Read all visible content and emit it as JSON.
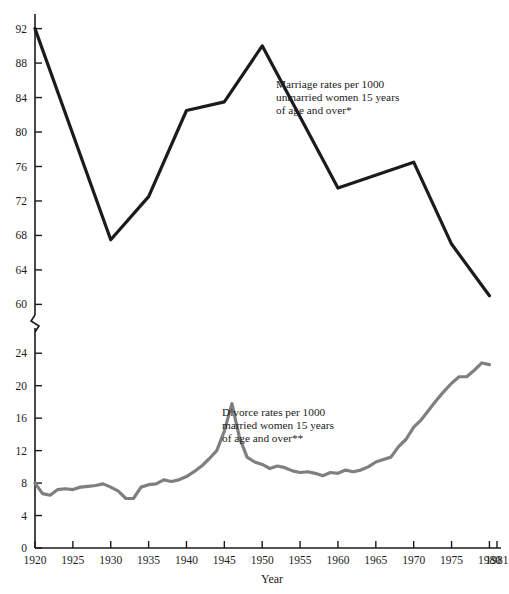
{
  "chart_data": {
    "type": "line",
    "title": "",
    "xlabel": "Year",
    "ylabel": "",
    "grid": false,
    "legend_position": "inline-annotations",
    "broken_axis": true,
    "axis_break_note": "Y axis is broken between the lower panel (0-24) and the upper panel (60-92)",
    "x": [
      1920,
      1921,
      1922,
      1923,
      1924,
      1925,
      1926,
      1927,
      1928,
      1929,
      1930,
      1931,
      1932,
      1933,
      1934,
      1935,
      1936,
      1937,
      1938,
      1939,
      1940,
      1941,
      1942,
      1943,
      1944,
      1945,
      1946,
      1947,
      1948,
      1949,
      1950,
      1951,
      1952,
      1953,
      1954,
      1955,
      1956,
      1957,
      1958,
      1959,
      1960,
      1961,
      1962,
      1963,
      1964,
      1965,
      1966,
      1967,
      1968,
      1969,
      1970,
      1971,
      1972,
      1973,
      1974,
      1975,
      1976,
      1977,
      1978,
      1979,
      1980
    ],
    "xlim": [
      1920,
      1981
    ],
    "xticks": [
      1920,
      1925,
      1930,
      1935,
      1940,
      1945,
      1950,
      1955,
      1960,
      1965,
      1970,
      1975,
      1980,
      1981
    ],
    "xticklabels": [
      "1920",
      "1925",
      "1930",
      "1935",
      "1940",
      "1945",
      "1950",
      "1955",
      "1960",
      "1965",
      "1970",
      "1975",
      "1980",
      "1981"
    ],
    "panels": [
      {
        "name": "upper",
        "ylim": [
          59,
          93
        ],
        "yticks": [
          60,
          64,
          68,
          72,
          76,
          80,
          84,
          88,
          92
        ],
        "yticklabels": [
          "60",
          "64",
          "68",
          "72",
          "76",
          "80",
          "84",
          "88",
          "92"
        ]
      },
      {
        "name": "lower",
        "ylim": [
          0,
          26
        ],
        "yticks": [
          0,
          4,
          8,
          12,
          16,
          20,
          24
        ],
        "yticklabels": [
          "0",
          "4",
          "8",
          "12",
          "16",
          "20",
          "24"
        ]
      }
    ],
    "series": [
      {
        "name": "Marriage rates per 1000 unmarried women 15 years of age and over*",
        "short_name": "marriage-rate",
        "panel": "upper",
        "color": "#1b1b1b",
        "linewidth": 3.2,
        "x": [
          1920,
          1930,
          1935,
          1940,
          1945,
          1950,
          1960,
          1970,
          1975,
          1980
        ],
        "values": [
          92.0,
          67.5,
          72.5,
          82.5,
          83.5,
          90.0,
          73.5,
          76.5,
          67.0,
          61.0
        ]
      },
      {
        "name": "Divorce rates per 1000 married women 15 years of age and over**",
        "short_name": "divorce-rate",
        "panel": "lower",
        "color": "#7f7f7f",
        "linewidth": 3.2,
        "x": [
          1920,
          1921,
          1922,
          1923,
          1924,
          1925,
          1926,
          1927,
          1928,
          1929,
          1930,
          1931,
          1932,
          1933,
          1934,
          1935,
          1936,
          1937,
          1938,
          1939,
          1940,
          1941,
          1942,
          1943,
          1944,
          1945,
          1946,
          1947,
          1948,
          1949,
          1950,
          1951,
          1952,
          1953,
          1954,
          1955,
          1956,
          1957,
          1958,
          1959,
          1960,
          1961,
          1962,
          1963,
          1964,
          1965,
          1966,
          1967,
          1968,
          1969,
          1970,
          1971,
          1972,
          1973,
          1974,
          1975,
          1976,
          1977,
          1978,
          1979,
          1980
        ],
        "values": [
          8.0,
          6.7,
          6.5,
          7.2,
          7.3,
          7.2,
          7.5,
          7.6,
          7.7,
          7.9,
          7.5,
          7.0,
          6.1,
          6.1,
          7.5,
          7.8,
          7.9,
          8.4,
          8.2,
          8.4,
          8.8,
          9.4,
          10.1,
          11.0,
          12.0,
          14.4,
          17.8,
          13.6,
          11.2,
          10.6,
          10.3,
          9.8,
          10.1,
          9.9,
          9.5,
          9.3,
          9.4,
          9.2,
          8.9,
          9.3,
          9.2,
          9.6,
          9.4,
          9.6,
          10.0,
          10.6,
          10.9,
          11.2,
          12.5,
          13.4,
          14.9,
          15.8,
          17.0,
          18.2,
          19.3,
          20.3,
          21.1,
          21.1,
          21.9,
          22.8,
          22.6
        ]
      }
    ],
    "annotations": [
      {
        "name": "marriage-annotation",
        "lines": [
          "Marriage rates per 1000",
          "unmarried women 15 years",
          "of age and over*"
        ],
        "x": 276,
        "y": 88
      },
      {
        "name": "divorce-annotation",
        "lines": [
          "Divorce rates per 1000",
          "married women 15 years",
          "of age and over**"
        ],
        "x": 222,
        "y": 416
      }
    ]
  },
  "axis": {
    "x_title": "Year",
    "origin_label": "0"
  },
  "colors": {
    "marriage_line": "#1b1b1b",
    "divorce_line": "#7f7f7f",
    "axis": "#1b1b1b",
    "background": "#ffffff",
    "text": "#1b1b1b"
  }
}
